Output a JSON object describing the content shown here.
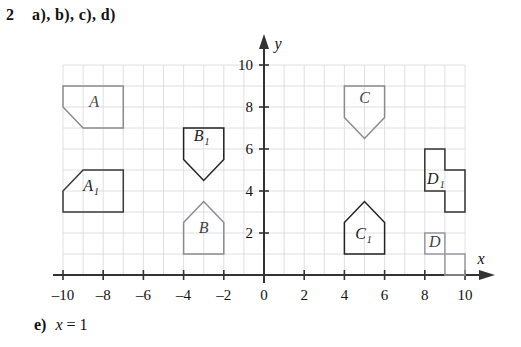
{
  "exercise": {
    "number": "2",
    "parts": "a), b), c), d)",
    "answer_label": "e)",
    "answer_value": "x = 1",
    "answer_var": "x",
    "answer_eq": "=",
    "answer_num": "1"
  },
  "axes": {
    "x_axis_name": "x",
    "y_axis_name": "y",
    "x_ticks": [
      {
        "value": -10,
        "label": "–10"
      },
      {
        "value": -8,
        "label": "–8"
      },
      {
        "value": -6,
        "label": "–6"
      },
      {
        "value": -4,
        "label": "–4"
      },
      {
        "value": -2,
        "label": "–2"
      },
      {
        "value": 0,
        "label": "0"
      },
      {
        "value": 2,
        "label": "2"
      },
      {
        "value": 4,
        "label": "4"
      },
      {
        "value": 6,
        "label": "6"
      },
      {
        "value": 8,
        "label": "8"
      },
      {
        "value": 10,
        "label": "10"
      }
    ],
    "y_ticks": [
      {
        "value": 2,
        "label": "2"
      },
      {
        "value": 4,
        "label": "4"
      },
      {
        "value": 6,
        "label": "6"
      },
      {
        "value": 8,
        "label": "8"
      },
      {
        "value": 10,
        "label": "10"
      }
    ],
    "xlim": [
      -10,
      10
    ],
    "ylim": [
      0,
      10
    ],
    "grid": true,
    "grid_color": "#d8d8dc",
    "axis_color": "#333333"
  },
  "chart_data": {
    "type": "diagram",
    "xlabel": "x",
    "ylabel": "y",
    "xlim": [
      -10,
      10
    ],
    "ylim": [
      0,
      10
    ],
    "grid": true,
    "mirror_line": "x = 1",
    "shapes": [
      {
        "name": "A",
        "label": "A",
        "subscript": "",
        "stroke": "#8a8a90",
        "label_x": -8.45,
        "label_y": 8.0,
        "points": [
          [
            -10,
            9
          ],
          [
            -7,
            9
          ],
          [
            -7,
            7
          ],
          [
            -9,
            7
          ],
          [
            -10,
            8
          ]
        ]
      },
      {
        "name": "A1",
        "label": "A",
        "subscript": "1",
        "stroke": "#3a3a3a",
        "label_x": -8.6,
        "label_y": 4.0,
        "points": [
          [
            -10,
            4
          ],
          [
            -9,
            5
          ],
          [
            -7,
            5
          ],
          [
            -7,
            3
          ],
          [
            -10,
            3
          ]
        ]
      },
      {
        "name": "B",
        "label": "B",
        "subscript": "",
        "stroke": "#8a8a90",
        "label_x": -3.0,
        "label_y": 2.0,
        "points": [
          [
            -4,
            1
          ],
          [
            -4,
            2.5
          ],
          [
            -3,
            3.5
          ],
          [
            -2,
            2.5
          ],
          [
            -2,
            1
          ]
        ]
      },
      {
        "name": "B1",
        "label": "B",
        "subscript": "1",
        "stroke": "#222222",
        "label_x": -3.1,
        "label_y": 6.4,
        "points": [
          [
            -4,
            7
          ],
          [
            -2,
            7
          ],
          [
            -2,
            5.5
          ],
          [
            -3,
            4.5
          ],
          [
            -4,
            5.5
          ]
        ]
      },
      {
        "name": "C",
        "label": "C",
        "subscript": "",
        "stroke": "#8a8a90",
        "label_x": 5.0,
        "label_y": 8.2,
        "points": [
          [
            4,
            9
          ],
          [
            6,
            9
          ],
          [
            6,
            7.5
          ],
          [
            5,
            6.5
          ],
          [
            4,
            7.5
          ]
        ]
      },
      {
        "name": "C1",
        "label": "C",
        "subscript": "1",
        "stroke": "#222222",
        "label_x": 4.95,
        "label_y": 1.7,
        "points": [
          [
            4,
            1
          ],
          [
            4,
            2.5
          ],
          [
            5,
            3.5
          ],
          [
            6,
            2.5
          ],
          [
            6,
            1
          ]
        ]
      },
      {
        "name": "D",
        "label": "D",
        "subscript": "",
        "stroke": "#9a9a9e",
        "label_x": 8.5,
        "label_y": 1.35,
        "points": [
          [
            8,
            2
          ],
          [
            9,
            2
          ],
          [
            9,
            1
          ],
          [
            10,
            1
          ],
          [
            10,
            0
          ],
          [
            9,
            0
          ],
          [
            9,
            1
          ],
          [
            8,
            1
          ]
        ]
      },
      {
        "name": "D1",
        "label": "D",
        "subscript": "1",
        "stroke": "#333333",
        "label_x": 8.55,
        "label_y": 4.35,
        "points": [
          [
            8,
            6
          ],
          [
            9,
            6
          ],
          [
            9,
            5
          ],
          [
            10,
            5
          ],
          [
            10,
            3
          ],
          [
            9,
            3
          ],
          [
            9,
            4
          ],
          [
            8,
            4
          ]
        ]
      }
    ]
  }
}
